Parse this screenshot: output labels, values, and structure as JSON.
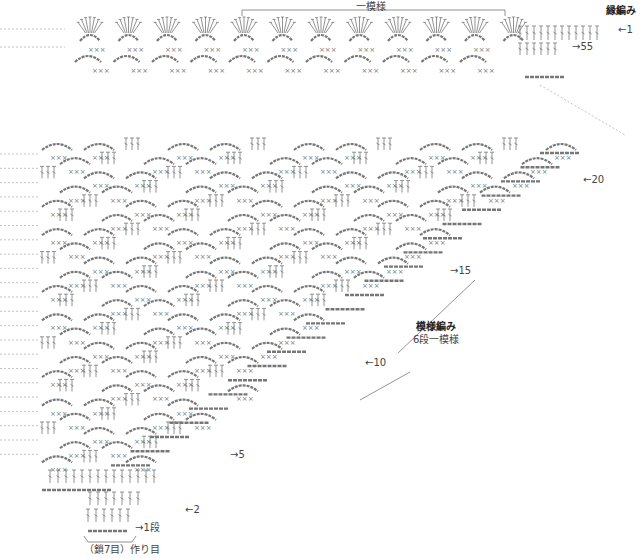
{
  "diagram": {
    "type": "crochet-chart",
    "border": {
      "title": "縁編み",
      "repeat_label": "一模様",
      "row_markers": [
        {
          "label": "←1",
          "x": 618,
          "y": 29
        },
        {
          "label": "→55",
          "x": 572,
          "y": 46
        }
      ]
    },
    "body": {
      "title": "模様編み",
      "subtitle": "6段一模様",
      "row_markers": [
        {
          "label": "←20",
          "x": 583,
          "y": 180
        },
        {
          "label": "→15",
          "x": 450,
          "y": 271
        },
        {
          "label": "←10",
          "x": 365,
          "y": 363
        },
        {
          "label": "→5",
          "x": 230,
          "y": 455
        },
        {
          "label": "←2",
          "x": 185,
          "y": 510
        },
        {
          "label": "→1段",
          "x": 135,
          "y": 528
        }
      ],
      "foundation_label": "（鎖7目）作り目"
    },
    "symbols": {
      "single_crochet": "×",
      "double_crochet": "T",
      "chain": "○"
    },
    "colors": {
      "stroke": "#777777",
      "dash": "#9a9a9a",
      "text": "#333333"
    }
  }
}
